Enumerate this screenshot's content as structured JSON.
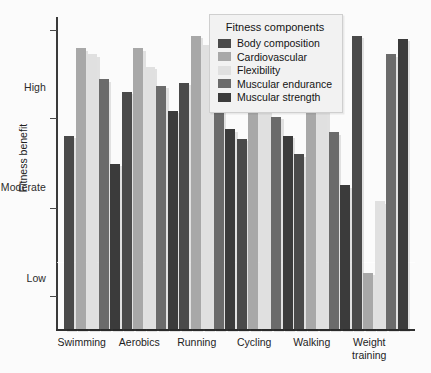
{
  "chart_data": {
    "type": "bar",
    "title": "",
    "xlabel": "",
    "ylabel": "Fitness benefit",
    "ylim": [
      0,
      1
    ],
    "grid": false,
    "legend_position": "top-center",
    "legend_title": "Fitness components",
    "ytick_labels": [
      "Low",
      "Moderate",
      "High"
    ],
    "categories": [
      "Swimming",
      "Aerobics",
      "Running",
      "Cycling",
      "Walking",
      "Weight\ntraining"
    ],
    "series": [
      {
        "name": "Body composition",
        "color": "#4a4a4a",
        "values": [
          0.62,
          0.76,
          0.79,
          0.61,
          0.56,
          0.94
        ]
      },
      {
        "name": "Cardiovascular",
        "color": "#a8a8a8",
        "values": [
          0.9,
          0.9,
          0.94,
          0.83,
          0.73,
          0.18
        ]
      },
      {
        "name": "Flexibility",
        "color": "#e0e0e0",
        "values": [
          0.88,
          0.84,
          0.91,
          0.8,
          0.71,
          0.41
        ]
      },
      {
        "name": "Muscular endurance",
        "color": "#6b6b6b",
        "values": [
          0.8,
          0.78,
          0.71,
          0.68,
          0.63,
          0.88
        ]
      },
      {
        "name": "Muscular strength",
        "color": "#3b3b3b",
        "values": [
          0.53,
          0.7,
          0.64,
          0.62,
          0.46,
          0.93
        ]
      }
    ]
  },
  "axis": {
    "y_title": "Fitness benefit",
    "tick_low": "Low",
    "tick_moderate": "Moderate",
    "tick_high": "High"
  },
  "legend": {
    "title": "Fitness components",
    "items": [
      {
        "label": "Body composition",
        "color": "#4a4a4a"
      },
      {
        "label": "Cardiovascular",
        "color": "#a8a8a8"
      },
      {
        "label": "Flexibility",
        "color": "#e0e0e0"
      },
      {
        "label": "Muscular endurance",
        "color": "#6b6b6b"
      },
      {
        "label": "Muscular strength",
        "color": "#3b3b3b"
      }
    ]
  },
  "xaxis": {
    "labels": [
      "Swimming",
      "Aerobics",
      "Running",
      "Cycling",
      "Walking",
      "Weight\ntraining"
    ]
  }
}
